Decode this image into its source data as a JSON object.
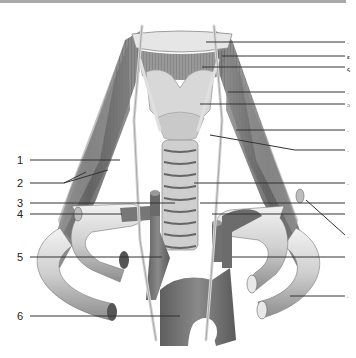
{
  "figure": {
    "colors": {
      "muscle": "#6e6e6e",
      "muscle_dark": "#4a4a4a",
      "cartilage": "#d9d9d9",
      "vessel": "#7a7a7a",
      "vessel_light": "#dcdcdc",
      "nerve": "#e2e2e2",
      "line": "#333333",
      "top_bar": "#a9a9a9"
    }
  },
  "left_labels": [
    {
      "num": "1",
      "y": 160
    },
    {
      "num": "2",
      "y": 183
    },
    {
      "num": "3",
      "y": 203
    },
    {
      "num": "4",
      "y": 214
    },
    {
      "num": "5",
      "y": 257
    },
    {
      "num": "6",
      "y": 316
    }
  ],
  "right_label_fragments": [
    {
      "text": "-",
      "y": 40
    },
    {
      "text": "ε",
      "y": 54
    },
    {
      "text": "ς",
      "y": 66
    },
    {
      "text": "-",
      "y": 90
    },
    {
      "text": "ↄ",
      "y": 102
    },
    {
      "text": "-",
      "y": 128
    },
    {
      "text": "-",
      "y": 148
    },
    {
      "text": "-",
      "y": 181
    },
    {
      "text": "-",
      "y": 234
    },
    {
      "text": "-",
      "y": 294
    }
  ]
}
